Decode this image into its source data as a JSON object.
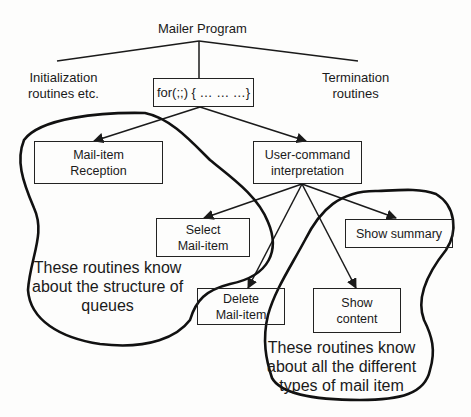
{
  "diagram": {
    "root": "Mailer Program",
    "left_branch": [
      "Initialization",
      "routines etc."
    ],
    "center_branch": "for(;;) { … … …}",
    "right_branch": [
      "Termination",
      "routines"
    ],
    "nodes": {
      "mail_item_reception": [
        "Mail-item",
        "Reception"
      ],
      "user_command": [
        "User-command",
        "interpretation"
      ],
      "select_mail_item": [
        "Select",
        "Mail-item"
      ],
      "show_summary": [
        "Show summary"
      ],
      "delete_mail_item": [
        "Delete",
        "Mail-item"
      ],
      "show_content": [
        "Show",
        "content"
      ]
    },
    "annotations": {
      "queues_group": [
        "These routines know",
        "about the structure of",
        "queues"
      ],
      "types_group": [
        "These routines know",
        "about all the different",
        "types of mail item"
      ]
    },
    "edges": [
      {
        "from": "Mailer Program",
        "to": "Initialization routines etc.",
        "style": "line"
      },
      {
        "from": "Mailer Program",
        "to": "for(;;) { … … …}",
        "style": "line"
      },
      {
        "from": "Mailer Program",
        "to": "Termination routines",
        "style": "line"
      },
      {
        "from": "for(;;) { … … …}",
        "to": "Mail-item Reception",
        "style": "arrow"
      },
      {
        "from": "for(;;) { … … …}",
        "to": "User-command interpretation",
        "style": "arrow"
      },
      {
        "from": "User-command interpretation",
        "to": "Select Mail-item",
        "style": "arrow"
      },
      {
        "from": "User-command interpretation",
        "to": "Delete Mail-item",
        "style": "arrow"
      },
      {
        "from": "User-command interpretation",
        "to": "Show content",
        "style": "arrow"
      },
      {
        "from": "User-command interpretation",
        "to": "Show summary",
        "style": "arrow"
      }
    ],
    "colors": {
      "ink": "#1a1a1a",
      "background": "#fdfdfc"
    }
  }
}
